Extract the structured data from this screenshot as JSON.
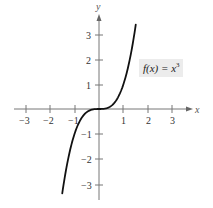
{
  "chart_data": {
    "type": "line",
    "title": "",
    "xlabel": "x",
    "ylabel": "y",
    "xlim": [
      -3.5,
      3.8
    ],
    "ylim": [
      -3.6,
      3.8
    ],
    "grid": false,
    "x_ticks": [
      -3,
      -2,
      -1,
      1,
      2,
      3
    ],
    "y_ticks": [
      3,
      2,
      1,
      -1,
      -2,
      -3
    ],
    "x_tick_labels": [
      "−3",
      "−2",
      "−1",
      "1",
      "2",
      "3"
    ],
    "y_tick_labels": [
      "3",
      "2",
      "1",
      "−1",
      "−2",
      "−3"
    ],
    "series": [
      {
        "name": "f(x) = x^3",
        "function": "x^3",
        "x": [
          -1.5,
          -1.25,
          -1.0,
          -0.75,
          -0.5,
          -0.25,
          0.0,
          0.25,
          0.5,
          0.75,
          1.0,
          1.25,
          1.5
        ],
        "y": [
          -3.375,
          -1.953,
          -1.0,
          -0.422,
          -0.125,
          -0.016,
          0.0,
          0.016,
          0.125,
          0.422,
          1.0,
          1.953,
          3.375
        ]
      }
    ],
    "annotations": [
      {
        "text_main": "f(x) = x",
        "superscript": "3",
        "position": [
          1.9,
          1.9
        ]
      }
    ],
    "legend": null
  }
}
